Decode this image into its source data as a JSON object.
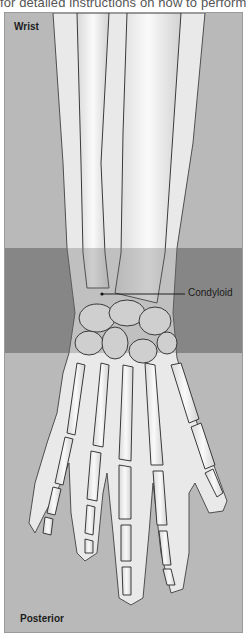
{
  "caption": "for detailed instructions on how to perform",
  "figure": {
    "region_label": "Wrist",
    "view_label": "Posterior",
    "callout": {
      "label": "Condyloid"
    },
    "colors": {
      "background": "#b9b9b9",
      "highlight_band": "#8d8d8d",
      "bone": "#f2f2f2",
      "outline": "#3a3a3a"
    }
  }
}
